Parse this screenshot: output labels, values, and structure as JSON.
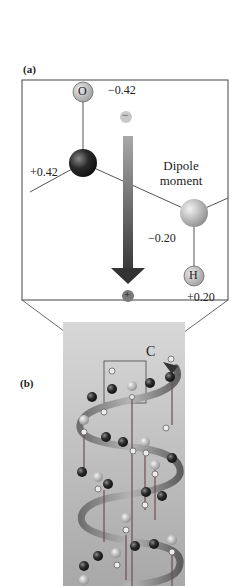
{
  "panel_a": {
    "label": "(a)",
    "atoms": {
      "oxygen": {
        "symbol": "O",
        "charge": "−0.42"
      },
      "carbon": {
        "symbol": "C",
        "charge": "+0.42"
      },
      "nitrogen": {
        "symbol": "N",
        "charge": "−0.20"
      },
      "hydrogen": {
        "symbol": "H",
        "charge": "+0.20"
      }
    },
    "dipole": {
      "label_line1": "Dipole",
      "label_line2": "moment",
      "negative_sign": "−",
      "positive_sign": "+"
    }
  },
  "panel_b": {
    "label": "(b)",
    "inset_label": "C"
  },
  "colors": {
    "arrow_top": "#9a9a9a",
    "arrow_bottom": "#3a3a3a",
    "ribbon": "#7a7a7a",
    "helix_bg": "#b9b9b9"
  }
}
